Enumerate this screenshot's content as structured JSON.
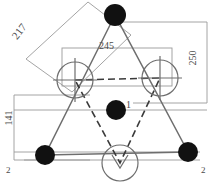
{
  "drawing": {
    "title": "Triangular fixture layout plan",
    "line_color": "#6e6e6e",
    "node_color": "#111111",
    "label_color": "#4a4a4a",
    "background": "#ffffff"
  },
  "dimensions": [
    {
      "id": "d217",
      "value": "217",
      "orientation": "diagonal",
      "angle_deg": -52,
      "note": "slanted side dimension, upper left"
    },
    {
      "id": "d245",
      "value": "245",
      "orientation": "horizontal",
      "angle_deg": 0,
      "note": "width between upper open circles"
    },
    {
      "id": "d250",
      "value": "250",
      "orientation": "vertical",
      "angle_deg": -90,
      "note": "overall height, right side"
    },
    {
      "id": "d141",
      "value": "141",
      "orientation": "vertical",
      "angle_deg": -90,
      "note": "lower height, left side"
    }
  ],
  "callouts": [
    {
      "id": "c1",
      "value": "1",
      "note": "center node callout"
    },
    {
      "id": "c2a",
      "value": "2",
      "note": "bottom left section marker"
    },
    {
      "id": "c2b",
      "value": "2",
      "note": "bottom right section marker"
    }
  ],
  "nodes": [
    {
      "id": "node-top",
      "type": "filled",
      "cx": 115,
      "cy": 15,
      "r": 11
    },
    {
      "id": "node-center",
      "type": "filled",
      "cx": 116,
      "cy": 110,
      "r": 10
    },
    {
      "id": "node-bottom-left",
      "type": "filled",
      "cx": 45,
      "cy": 155,
      "r": 10
    },
    {
      "id": "node-bottom-right",
      "type": "filled",
      "cx": 188,
      "cy": 152,
      "r": 10
    },
    {
      "id": "circle-left",
      "type": "open",
      "cx": 75,
      "cy": 80,
      "r": 18
    },
    {
      "id": "circle-right",
      "type": "open",
      "cx": 160,
      "cy": 78,
      "r": 18
    },
    {
      "id": "circle-bottom",
      "type": "open",
      "cx": 120,
      "cy": 163,
      "r": 18
    }
  ]
}
